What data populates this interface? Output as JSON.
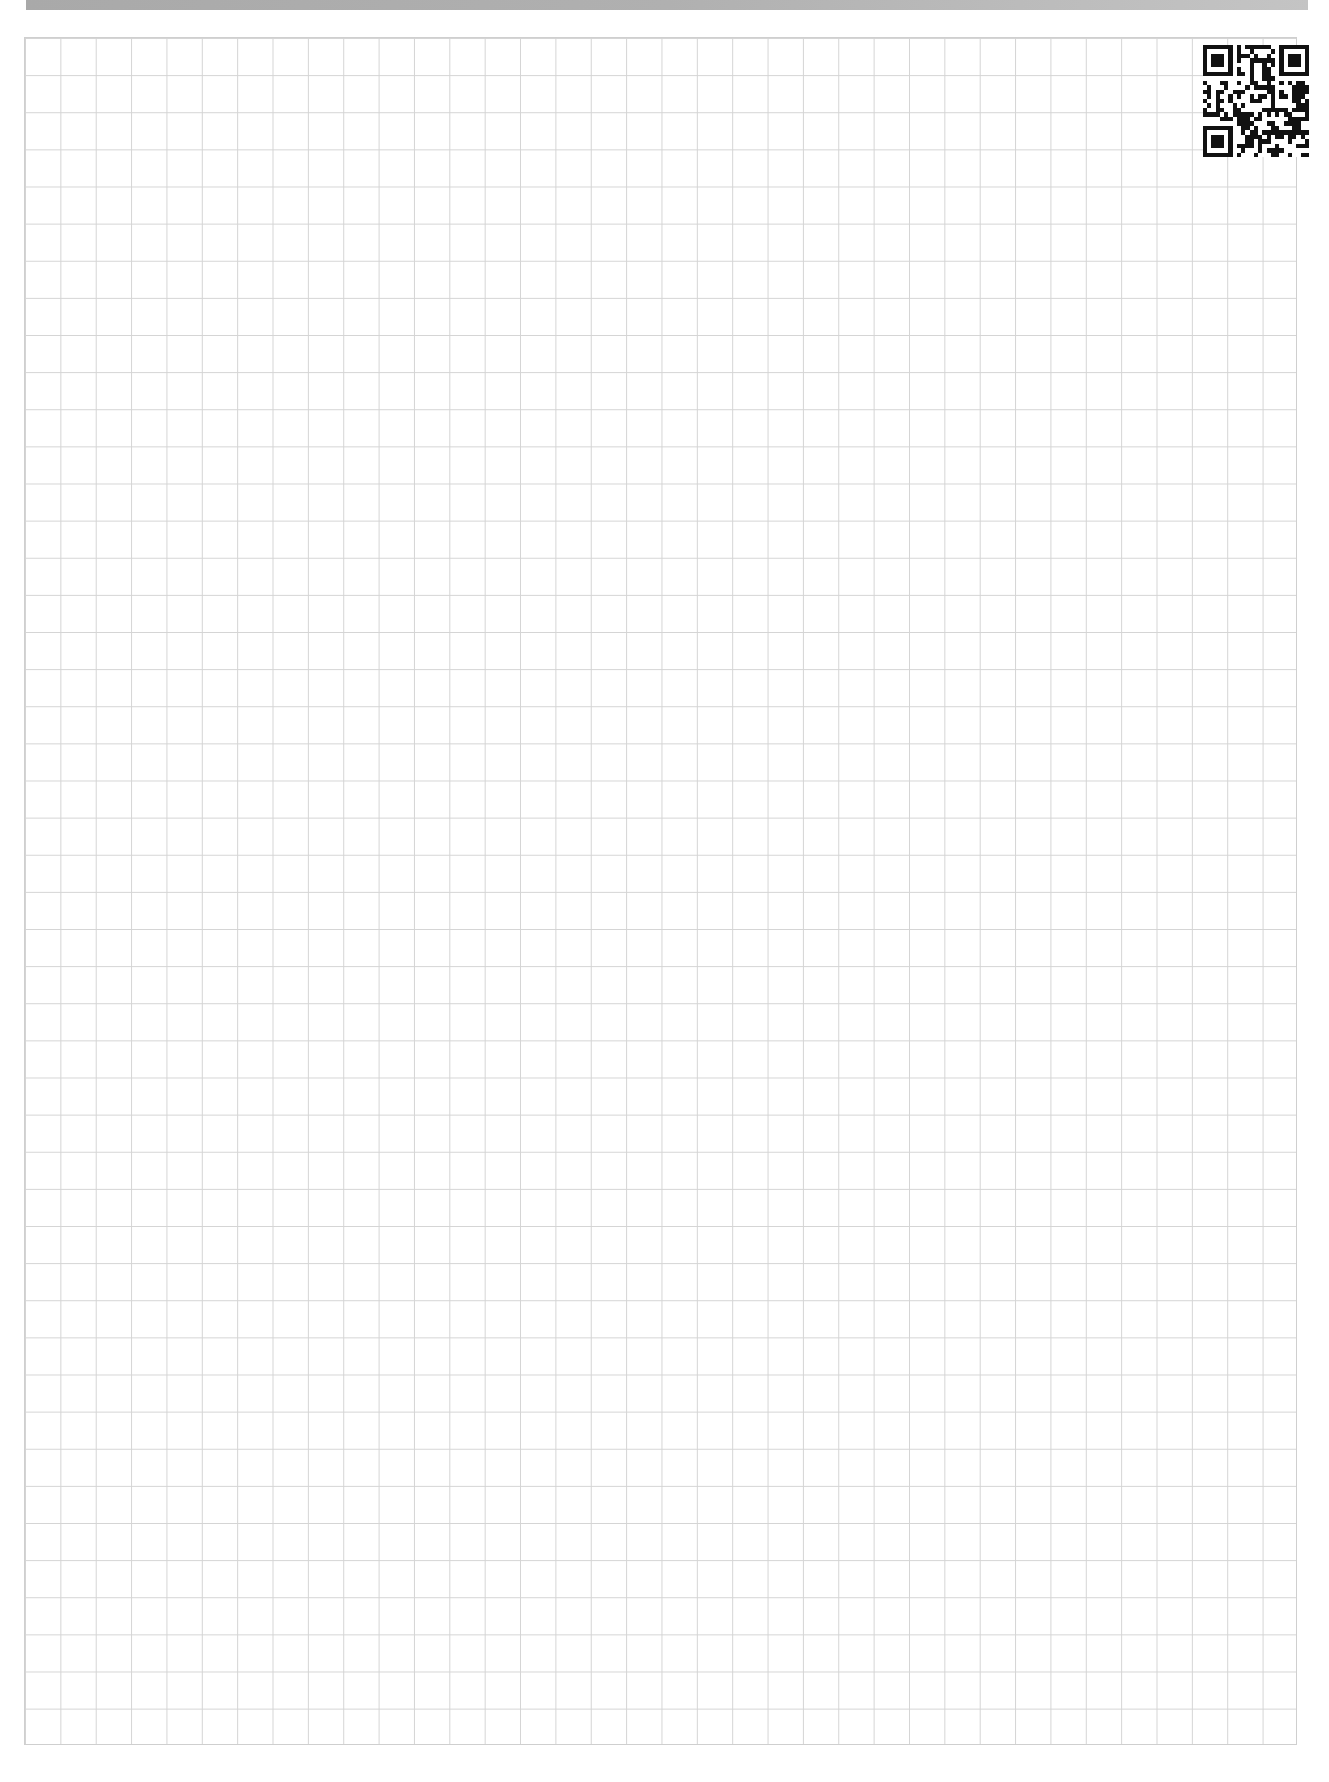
{
  "header": {
    "title": "",
    "title_visible": false,
    "background_color": "#b0b0b0"
  },
  "page": {
    "type": "graph-paper",
    "grid": {
      "columns": 36,
      "rows": 46,
      "line_color": "#d4d4d4",
      "background_color": "#ffffff"
    },
    "qr_code": {
      "present": true,
      "position": "top-right",
      "color": "#111111"
    }
  }
}
